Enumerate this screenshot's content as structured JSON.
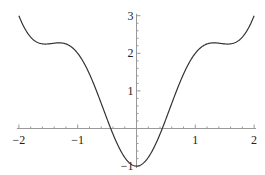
{
  "chart_data": {
    "type": "line",
    "title": "",
    "xlabel": "",
    "ylabel": "",
    "function": "x^2 - cos(pi x)",
    "xlim": [
      -2,
      2
    ],
    "ylim": [
      -1,
      3
    ],
    "grid": false,
    "legend": null,
    "axes_origin": [
      0,
      0
    ],
    "x_ticks": [
      -2,
      -1,
      1,
      2
    ],
    "x_tick_labels": [
      "−2",
      "−1",
      "1",
      "2"
    ],
    "y_ticks": [
      -1,
      1,
      2,
      3
    ],
    "y_tick_labels": [
      "−1",
      "1",
      "2",
      "3"
    ],
    "minor_tick_step": 0.2,
    "series": [
      {
        "name": "f(x)",
        "color": "#333333",
        "x": [
          -2.0,
          -1.9,
          -1.8,
          -1.7,
          -1.6,
          -1.5,
          -1.4,
          -1.3,
          -1.2,
          -1.1,
          -1.0,
          -0.9,
          -0.8,
          -0.7,
          -0.6,
          -0.5,
          -0.4,
          -0.3,
          -0.2,
          -0.1,
          0.0,
          0.1,
          0.2,
          0.3,
          0.4,
          0.5,
          0.6,
          0.7,
          0.8,
          0.9,
          1.0,
          1.1,
          1.2,
          1.3,
          1.4,
          1.5,
          1.6,
          1.7,
          1.8,
          1.9,
          2.0
        ],
        "y": [
          3.0,
          2.66,
          2.43,
          2.3,
          2.25,
          2.25,
          2.27,
          2.28,
          2.25,
          2.16,
          2.0,
          1.76,
          1.45,
          1.08,
          0.67,
          0.25,
          -0.15,
          -0.5,
          -0.77,
          -0.94,
          -1.0,
          -0.94,
          -0.77,
          -0.5,
          -0.15,
          0.25,
          0.67,
          1.08,
          1.45,
          1.76,
          2.0,
          2.16,
          2.25,
          2.28,
          2.27,
          2.25,
          2.25,
          2.3,
          2.43,
          2.66,
          3.0
        ]
      }
    ]
  }
}
